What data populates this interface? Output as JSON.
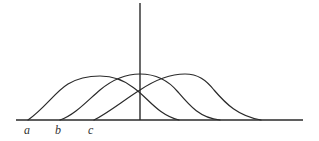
{
  "figure": {
    "labels": [
      {
        "id": "a",
        "text": "a",
        "x": 27
      },
      {
        "id": "b",
        "text": "b",
        "x": 58
      },
      {
        "id": "c",
        "text": "c",
        "x": 91
      }
    ],
    "axis": {
      "baseline_y": 120,
      "x_start": 16,
      "x_end": 303,
      "vertical_line_x": 140,
      "vertical_top_y": 3
    },
    "curves": [
      {
        "name": "curve-a",
        "start_x": 28,
        "peak_x": 100,
        "peak_y": 76,
        "end_x": 179
      },
      {
        "name": "curve-b",
        "start_x": 60,
        "peak_x": 140,
        "peak_y": 74,
        "end_x": 220
      },
      {
        "name": "curve-c",
        "start_x": 94,
        "peak_x": 185,
        "peak_y": 74,
        "end_x": 261
      }
    ],
    "colors": {
      "stroke": "#2a2a2a",
      "background": "#ffffff"
    }
  }
}
